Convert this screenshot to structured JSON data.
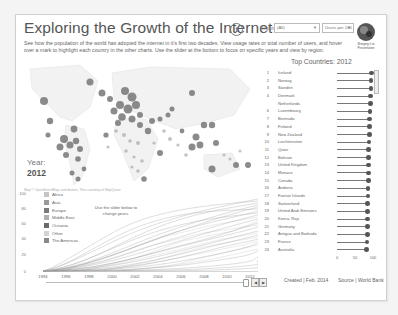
{
  "header": {
    "title": "Exploring the Growth of the Internet",
    "info_icon": "i",
    "description": "See how the population of the world has adopted the internet in it's first two decades. View usage rates or total number of users, and hover over a mark to highlight each country in the other charts. Use the slider at the bottom to focus on specific years and view by region."
  },
  "controls": {
    "region_label": "Region:",
    "region_value": "(All)",
    "measure_value": "Users per 100",
    "logo_caption": "Bringing it to Presentation"
  },
  "map": {
    "year_label": "Year:",
    "year_value": "2012",
    "credit": "Map © OpenStreetMap contributors, Tiles courtesy of MapQuest"
  },
  "legend": {
    "items": [
      {
        "label": "Africa",
        "color": "#c4c4c4"
      },
      {
        "label": "Asia",
        "color": "#9a9a9a"
      },
      {
        "label": "Europe",
        "color": "#7a7a7a"
      },
      {
        "label": "Middle East",
        "color": "#b0b0b0"
      },
      {
        "label": "Oceania",
        "color": "#6a6a6a"
      },
      {
        "label": "Other",
        "color": "#d4d4d4"
      },
      {
        "label": "The Americas",
        "color": "#888888"
      }
    ],
    "hint": "Use the slider below to change years."
  },
  "line_chart": {
    "yticks": [
      "100",
      "80",
      "60",
      "40",
      "20",
      "0"
    ],
    "xticks": [
      "1994",
      "1996",
      "1998",
      "2000",
      "2002",
      "2004",
      "2006",
      "2008",
      "2010",
      "2012"
    ]
  },
  "slider": {
    "prev_label": "◀",
    "next_label": "▶"
  },
  "top_countries": {
    "title": "Top Countries: 2012",
    "rows": [
      {
        "rank": "1",
        "name": "Iceland",
        "value": 96
      },
      {
        "rank": "2",
        "name": "Norway",
        "value": 95
      },
      {
        "rank": "3",
        "name": "Sweden",
        "value": 94
      },
      {
        "rank": "4",
        "name": "Denmark",
        "value": 93
      },
      {
        "rank": "",
        "name": "Netherlands",
        "value": 93
      },
      {
        "rank": "6",
        "name": "Luxembourg",
        "value": 92
      },
      {
        "rank": "7",
        "name": "Bermuda",
        "value": 91
      },
      {
        "rank": "8",
        "name": "Finland",
        "value": 91
      },
      {
        "rank": "9",
        "name": "New Zealand",
        "value": 90
      },
      {
        "rank": "10",
        "name": "Liechtenstein",
        "value": 89
      },
      {
        "rank": "11",
        "name": "Qatar",
        "value": 88
      },
      {
        "rank": "12",
        "name": "Bahrain",
        "value": 88
      },
      {
        "rank": "13",
        "name": "United Kingdom",
        "value": 87
      },
      {
        "rank": "14",
        "name": "Monaco",
        "value": 87
      },
      {
        "rank": "15",
        "name": "Canada",
        "value": 87
      },
      {
        "rank": "16",
        "name": "Andorra",
        "value": 86
      },
      {
        "rank": "17",
        "name": "Faeroe Islands",
        "value": 86
      },
      {
        "rank": "18",
        "name": "Switzerland",
        "value": 85
      },
      {
        "rank": "19",
        "name": "United Arab Emirates",
        "value": 85
      },
      {
        "rank": "20",
        "name": "Korea, Rep.",
        "value": 84
      },
      {
        "rank": "21",
        "name": "Germany",
        "value": 84
      },
      {
        "rank": "22",
        "name": "Antigua and Barbuda",
        "value": 84
      },
      {
        "rank": "23",
        "name": "France",
        "value": 83
      },
      {
        "rank": "24",
        "name": "Australia",
        "value": 82
      }
    ],
    "axis_ticks": [
      "0",
      "50",
      "100"
    ]
  },
  "footer": {
    "created": "Created | Feb. 2014",
    "source": "Source | World Bank"
  }
}
